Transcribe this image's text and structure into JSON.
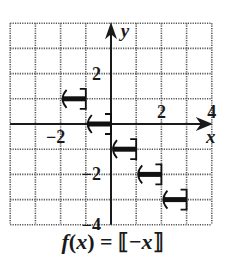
{
  "chart_data": {
    "type": "line",
    "title": "f(x) = ⟦−x⟧",
    "xlabel": "x",
    "ylabel": "y",
    "xlim": [
      -4,
      4
    ],
    "ylim": [
      -4,
      4
    ],
    "grid": true,
    "x_tick_labels": [
      {
        "value": -2,
        "label": "−2"
      },
      {
        "value": 2,
        "label": "2"
      },
      {
        "value": 4,
        "label": "4"
      }
    ],
    "y_tick_labels": [
      {
        "value": 2,
        "label": "2"
      },
      {
        "value": -2,
        "label": "−2"
      },
      {
        "value": -4,
        "label": "−4"
      }
    ],
    "segments": [
      {
        "x_start": -2,
        "x_end": -1,
        "y": 1,
        "left": "open",
        "right": "closed"
      },
      {
        "x_start": -1,
        "x_end": 0,
        "y": 0,
        "left": "open",
        "right": "closed"
      },
      {
        "x_start": 0,
        "x_end": 1,
        "y": -1,
        "left": "open",
        "right": "closed"
      },
      {
        "x_start": 1,
        "x_end": 2,
        "y": -2,
        "left": "open",
        "right": "closed"
      },
      {
        "x_start": 2,
        "x_end": 3,
        "y": -3,
        "left": "open",
        "right": "closed"
      }
    ],
    "colors": {
      "axis": "#1a1a1a",
      "grid": "#555555",
      "curve": "#111111"
    }
  },
  "caption": {
    "prefix": "f",
    "paren_open": "(",
    "var": "x",
    "paren_close": ")",
    "equals": " = ⟦−",
    "var2": "x",
    "close": "⟧"
  },
  "axis_labels": {
    "x": "x",
    "y": "y"
  }
}
